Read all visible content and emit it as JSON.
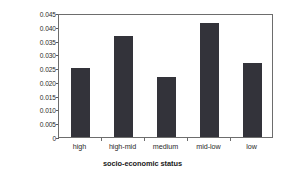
{
  "chart_data": {
    "type": "bar",
    "title": "",
    "xlabel": "socio-economic status",
    "ylabel": "age-adjusted incidence (per 100,000)",
    "ylabel_lines": [
      "age-adjusted incidence",
      "(per 100,000)"
    ],
    "categories": [
      "high",
      "high-mid",
      "medium",
      "mid-low",
      "low"
    ],
    "values": [
      0.025,
      0.0368,
      0.0216,
      0.0415,
      0.0268
    ],
    "ylim": [
      0,
      0.045
    ],
    "yticks": [
      0,
      0.005,
      0.01,
      0.015,
      0.02,
      0.025,
      0.03,
      0.035,
      0.04,
      0.045
    ],
    "ytick_labels": [
      "0",
      "0.005",
      "0.010",
      "0.015",
      "0.020",
      "0.025",
      "0.030",
      "0.035",
      "0.040",
      "0.045"
    ],
    "grid": false,
    "legend": null,
    "bar_color": "#33333a",
    "axis_color": "#6d6d6d",
    "background": "#ffffff"
  }
}
